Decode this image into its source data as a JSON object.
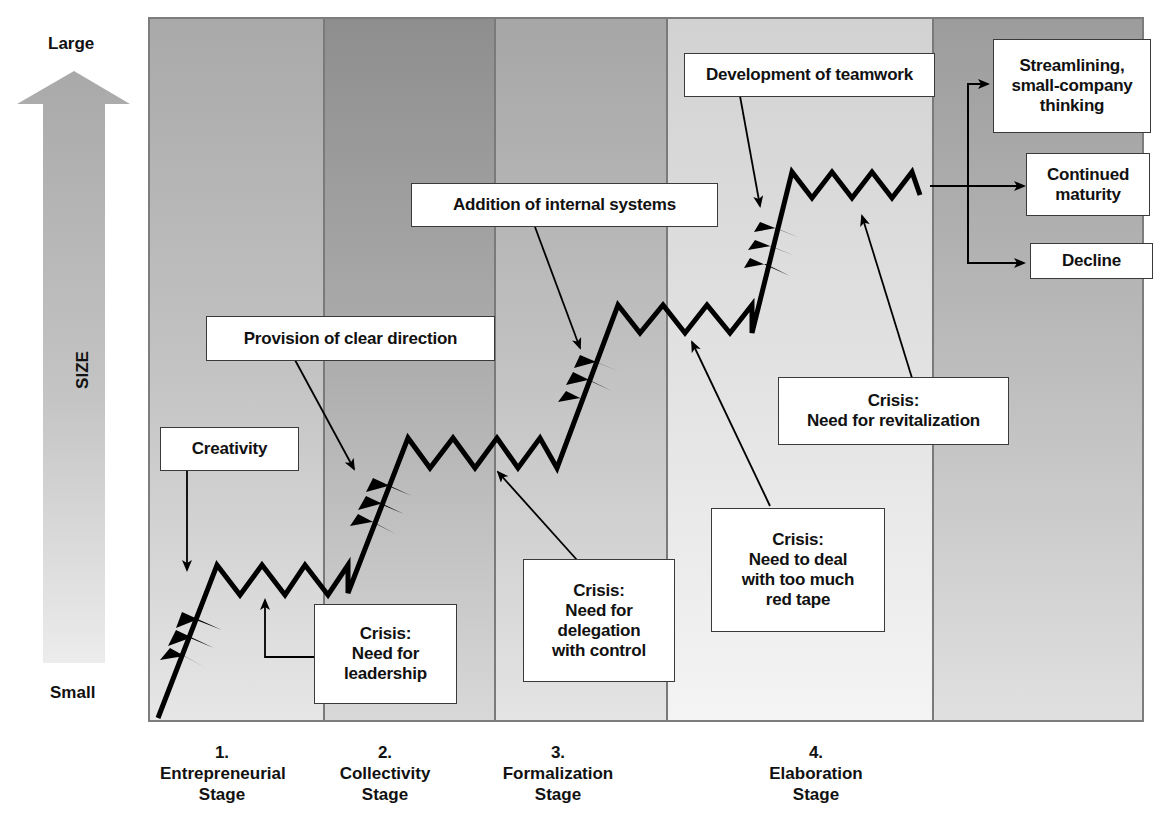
{
  "axis": {
    "top_label": "Large",
    "bottom_label": "Small",
    "title": "SIZE"
  },
  "stages": [
    {
      "number": "1.",
      "name": "Entrepreneurial",
      "suffix": "Stage"
    },
    {
      "number": "2.",
      "name": "Collectivity",
      "suffix": "Stage"
    },
    {
      "number": "3.",
      "name": "Formalization",
      "suffix": "Stage"
    },
    {
      "number": "4.",
      "name": "Elaboration",
      "suffix": "Stage"
    }
  ],
  "growth_labels": {
    "creativity": "Creativity",
    "clear_direction": "Provision of clear direction",
    "internal_systems": "Addition of internal systems",
    "teamwork": "Development of teamwork"
  },
  "crisis_labels": {
    "leadership": {
      "line1": "Crisis:",
      "line2": "Need for",
      "line3": "leadership"
    },
    "delegation": {
      "line1": "Crisis:",
      "line2": "Need for",
      "line3": "delegation",
      "line4": "with control"
    },
    "red_tape": {
      "line1": "Crisis:",
      "line2": "Need to deal",
      "line3": "with too much",
      "line4": "red tape"
    },
    "revitalization": {
      "line1": "Crisis:",
      "line2": "Need for revitalization"
    }
  },
  "outcomes": {
    "streamlining": {
      "line1": "Streamlining,",
      "line2": "small-company",
      "line3": "thinking"
    },
    "maturity": {
      "line1": "Continued",
      "line2": "maturity"
    },
    "decline": {
      "line1": "Decline"
    }
  },
  "colors": {
    "line": "#000000",
    "box_border": "#3a3a3a",
    "frame_border": "#7d7d7d",
    "arrow_fill": "#b0b0b0"
  }
}
